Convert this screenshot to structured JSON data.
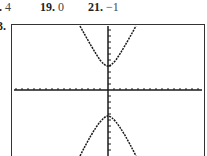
{
  "answers": [
    {
      "number": ".",
      "value": "4",
      "left": -1
    },
    {
      "number": "19.",
      "value": "0",
      "left": 40
    },
    {
      "number": "21.",
      "value": "−1",
      "left": 88
    }
  ],
  "exercise_label": "3.",
  "graph": {
    "type": "calculator-graph",
    "description": "Hyperbola opening up and down, centered at origin",
    "colors": {
      "curve": "#1a1a1a",
      "axis": "#1a1a1a",
      "frame": "#333333"
    },
    "x_ticks_each_side": 15,
    "y_ticks_each_side": 10
  }
}
